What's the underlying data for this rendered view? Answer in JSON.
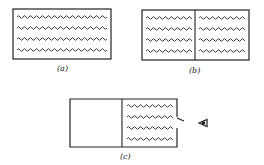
{
  "figure": {
    "panels": [
      {
        "id": "a",
        "label": "(a)",
        "description": "Single closed box completely filled with gas (wavy lines), 4 rows"
      },
      {
        "id": "b",
        "label": "(b)",
        "description": "Box divided into two halves by a partition, both halves filled with gas"
      },
      {
        "id": "c",
        "label": "(c)",
        "description": "Box divided by partition; left half empty, right half filled with gas with a small opening on right wall, observer eye outside"
      }
    ],
    "colors": {
      "stroke": "#222222",
      "background": "#ffffff"
    },
    "icons": {
      "observer": "eye-icon"
    }
  }
}
